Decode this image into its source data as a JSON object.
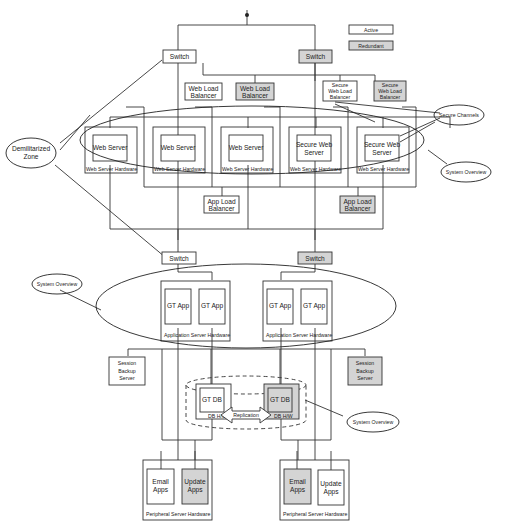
{
  "colors": {
    "active": "#ffffff",
    "redundant": "#d4d4d4",
    "stroke": "#333333",
    "text": "#222222"
  },
  "legend": {
    "active": "Active",
    "redundant": "Redundant"
  },
  "callouts": {
    "dmz": [
      "Demilitarized",
      "Zone"
    ],
    "secure_channels": "Secure Channels",
    "system_overview_web": "System Overview",
    "system_overview_app": "System Overview",
    "system_overview_db": "System Overview"
  },
  "web_tier": {
    "switch_active": "Switch",
    "switch_redundant": "Switch",
    "load_balancers": [
      {
        "lines": [
          "Web Load",
          "Balancer"
        ],
        "state": "active"
      },
      {
        "lines": [
          "Web Load",
          "Balancer"
        ],
        "state": "redundant"
      },
      {
        "lines": [
          "Secure",
          "Web Load",
          "Balancer"
        ],
        "state": "active"
      },
      {
        "lines": [
          "Secure",
          "Web Load",
          "Balancer"
        ],
        "state": "redundant"
      }
    ],
    "servers": [
      {
        "lines": [
          "Web Server"
        ],
        "hardware": "Web Server Hardware"
      },
      {
        "lines": [
          "Web Server"
        ],
        "hardware": "Web Server Hardware"
      },
      {
        "lines": [
          "Web Server"
        ],
        "hardware": "Web Server Hardware"
      },
      {
        "lines": [
          "Secure Web",
          "Server"
        ],
        "hardware": "Web Server Hardware"
      },
      {
        "lines": [
          "Secure Web",
          "Server"
        ],
        "hardware": "Web Server Hardware"
      }
    ],
    "app_load_balancers": [
      {
        "lines": [
          "App Load",
          "Balancer"
        ],
        "state": "active"
      },
      {
        "lines": [
          "App Load",
          "Balancer"
        ],
        "state": "redundant"
      }
    ]
  },
  "app_tier": {
    "switch_active": "Switch",
    "switch_redundant": "Switch",
    "hardware": [
      {
        "label": "Application Server Hardware",
        "apps": [
          "GT App",
          "GT App"
        ]
      },
      {
        "label": "Application Server Hardware",
        "apps": [
          "GT App",
          "GT App"
        ]
      }
    ],
    "session_backup": [
      {
        "lines": [
          "Session",
          "Backup",
          "Server"
        ],
        "state": "active"
      },
      {
        "lines": [
          "Session",
          "Backup",
          "Server"
        ],
        "state": "redundant"
      }
    ]
  },
  "db_tier": {
    "db_active": "GT DB",
    "db_redundant": "GT DB",
    "hw_active": "DB H/W",
    "hw_redundant": "DB H/W",
    "replication": "Replication"
  },
  "peripheral_tier": [
    {
      "label": "Peripheral Server Hardware",
      "apps": [
        {
          "lines": [
            "Email",
            "Apps"
          ],
          "state": "active"
        },
        {
          "lines": [
            "Update",
            "Apps"
          ],
          "state": "redundant"
        }
      ]
    },
    {
      "label": "Peripheral Server Hardware",
      "apps": [
        {
          "lines": [
            "Email",
            "Apps"
          ],
          "state": "redundant"
        },
        {
          "lines": [
            "Update",
            "Apps"
          ],
          "state": "active"
        }
      ]
    }
  ]
}
